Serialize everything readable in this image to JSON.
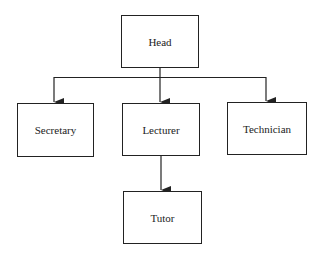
{
  "diagram": {
    "type": "org-chart",
    "nodes": [
      {
        "id": "head",
        "label": "Head"
      },
      {
        "id": "secretary",
        "label": "Secretary"
      },
      {
        "id": "lecturer",
        "label": "Lecturer"
      },
      {
        "id": "technician",
        "label": "Technician"
      },
      {
        "id": "tutor",
        "label": "Tutor"
      }
    ],
    "edges": [
      {
        "from": "head",
        "to": "secretary"
      },
      {
        "from": "head",
        "to": "lecturer"
      },
      {
        "from": "head",
        "to": "technician"
      },
      {
        "from": "lecturer",
        "to": "tutor"
      }
    ],
    "colors": {
      "line": "#222222",
      "background": "#ffffff"
    }
  }
}
